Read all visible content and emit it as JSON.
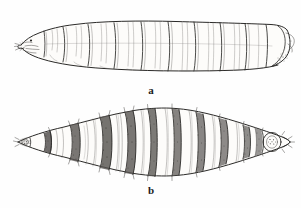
{
  "plate": {
    "width": 301,
    "height": 208,
    "background_color": "#fefefe",
    "ink_color": "#2b2a28",
    "title": "",
    "subject": "fly larva (maggot)",
    "style": "pen-and-ink scientific line drawing"
  },
  "figures": [
    {
      "id": "a",
      "caption": "a",
      "view": "lateral",
      "orientation": "head at left, posterior at right",
      "segment_count": 11,
      "bounds": {
        "x": 18,
        "y": 20,
        "width": 270,
        "height": 52
      },
      "features": [
        "pointed cephalic end with mouth hooks",
        "transverse intersegmental creases",
        "truncated posterior with spiracular field"
      ]
    },
    {
      "id": "b",
      "caption": "b",
      "view": "dorsal",
      "orientation": "head at left, posterior at right",
      "segment_count": 11,
      "bounds": {
        "x": 17,
        "y": 107,
        "width": 273,
        "height": 69
      },
      "features": [
        "tapered anterior and posterior ends",
        "dark stippled spinose intersegmental bands",
        "paired lateral setae projecting from margins",
        "rounded posterior spiracular plate"
      ]
    }
  ],
  "captions": {
    "a": "a",
    "b": "b"
  }
}
